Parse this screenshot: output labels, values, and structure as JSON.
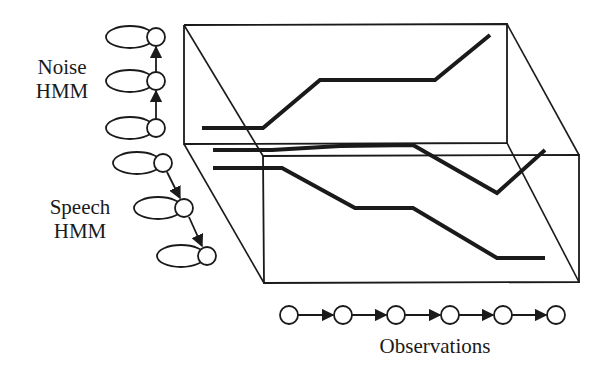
{
  "labels": {
    "noise_line1": "Noise",
    "noise_line2": "HMM",
    "speech_line1": "Speech",
    "speech_line2": "HMM",
    "observations": "Observations"
  },
  "colors": {
    "ink": "#1a1a1a",
    "background": "#ffffff"
  },
  "noise_hmm": {
    "states": 3,
    "direction": "upward",
    "circle_centers": [
      [
        156,
        128
      ],
      [
        156,
        81
      ],
      [
        156,
        37
      ]
    ]
  },
  "speech_hmm": {
    "states": 3,
    "direction": "downward-right",
    "circle_centers": [
      [
        163,
        163
      ],
      [
        184,
        208
      ],
      [
        207,
        256
      ]
    ]
  },
  "observations": {
    "count": 6,
    "y": 315,
    "x_centers": [
      289,
      343,
      396,
      450,
      503,
      556
    ]
  }
}
